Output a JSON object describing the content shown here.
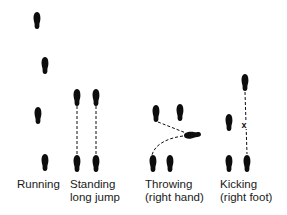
{
  "figure": {
    "colors": {
      "ink": "#0d0d0d",
      "background": "#ffffff"
    },
    "panels": [
      {
        "id": "running",
        "label_line1": "Running",
        "label_line2": ""
      },
      {
        "id": "standing-long-jump",
        "label_line1": "Standing",
        "label_line2": "long jump"
      },
      {
        "id": "throwing",
        "label_line1": "Throwing",
        "label_line2": "(right hand)"
      },
      {
        "id": "kicking",
        "label_line1": "Kicking",
        "label_line2": "(right foot)"
      }
    ],
    "kick_marker": "x"
  }
}
